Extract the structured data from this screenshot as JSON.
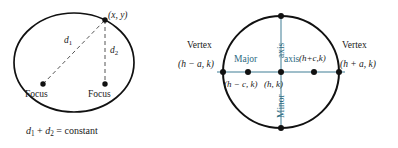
{
  "figure": {
    "background_color": "#ffffff",
    "ink_color": "#1a1a1a",
    "accent_color": "#2c6b82",
    "axis_line_color": "#7fa8b8"
  },
  "left_diagram": {
    "name": "ellipse-focus-definition",
    "point_label": "(x, y)",
    "distance_1": "d",
    "distance_1_sub": "1",
    "distance_2": "d",
    "distance_2_sub": "2",
    "focus_left_label": "Focus",
    "focus_right_label": "Focus",
    "caption_d1": "d",
    "caption_d1_sub": "1",
    "caption_plus": "+",
    "caption_d2": "d",
    "caption_d2_sub": "2",
    "caption_equals": "=",
    "caption_constant": "constant"
  },
  "right_diagram": {
    "name": "ellipse-standard-form-parts",
    "vertex_left_label": "Vertex",
    "vertex_left_coords": "(h − a, k)",
    "vertex_right_label": "Vertex",
    "vertex_right_coords": "(h + a, k)",
    "focus_left_coords": "(h − c, k)",
    "focus_right_coords": "(h+c,k)",
    "center_coords": "(h, k)",
    "major_axis_word_1": "Major",
    "major_axis_word_2": "axis",
    "minor_axis_word_1": "Minor",
    "minor_axis_word_2": "axis"
  }
}
